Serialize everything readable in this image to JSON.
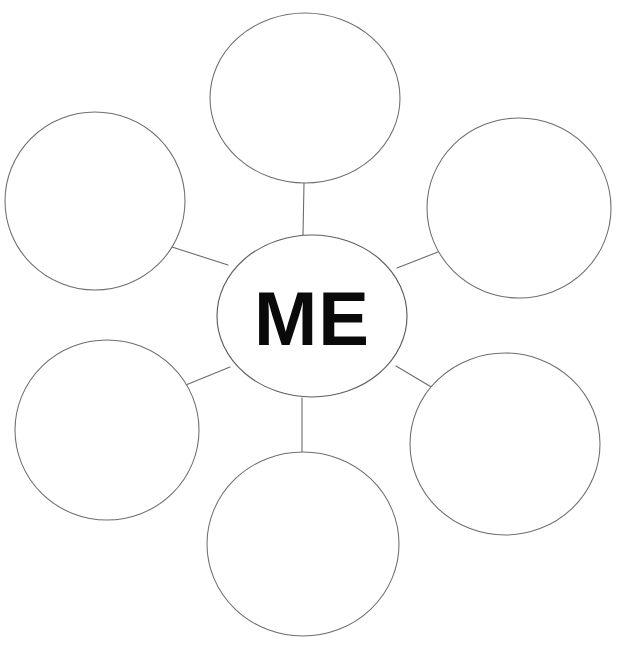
{
  "page": {
    "background_color": "#ffffff",
    "width": 622,
    "height": 647,
    "clipped_header_text": ""
  },
  "diagram": {
    "type": "bubble-map",
    "title": "",
    "line_color": "#6b6b70",
    "outline_color": "#5f5f63",
    "fill_color": "#ffffff",
    "text_color": "#0a0a0a",
    "center": {
      "label": "ME",
      "cx": 312,
      "cy": 316,
      "rx": 95,
      "ry": 81
    },
    "satellites": [
      {
        "id": "top",
        "label": "",
        "cx": 305,
        "cy": 98,
        "rx": 95,
        "ry": 85
      },
      {
        "id": "top-left",
        "label": "",
        "cx": 95,
        "cy": 201,
        "rx": 90,
        "ry": 89
      },
      {
        "id": "top-right",
        "label": "",
        "cx": 519,
        "cy": 208,
        "rx": 92,
        "ry": 90
      },
      {
        "id": "bottom-left",
        "label": "",
        "cx": 107,
        "cy": 430,
        "rx": 92,
        "ry": 90
      },
      {
        "id": "bottom-right",
        "label": "",
        "cx": 505,
        "cy": 444,
        "rx": 95,
        "ry": 91
      },
      {
        "id": "bottom",
        "label": "",
        "cx": 303,
        "cy": 544,
        "rx": 96,
        "ry": 92
      }
    ],
    "connectors": [
      {
        "id": "center-to-top",
        "x1": 303,
        "y1": 235,
        "x2": 304,
        "y2": 183
      },
      {
        "id": "center-to-top-left",
        "x1": 228,
        "y1": 265,
        "x2": 172,
        "y2": 247
      },
      {
        "id": "center-to-top-right",
        "x1": 397,
        "y1": 268,
        "x2": 443,
        "y2": 250
      },
      {
        "id": "center-to-bottom-left",
        "x1": 230,
        "y1": 367,
        "x2": 176,
        "y2": 389
      },
      {
        "id": "center-to-bottom-right",
        "x1": 396,
        "y1": 366,
        "x2": 443,
        "y2": 394
      },
      {
        "id": "center-to-bottom",
        "x1": 302,
        "y1": 398,
        "x2": 302,
        "y2": 452
      }
    ]
  }
}
